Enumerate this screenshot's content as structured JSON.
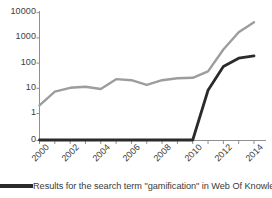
{
  "chart_data": {
    "type": "line",
    "title": "",
    "subtitle": "",
    "xlabel": "",
    "ylabel": "",
    "x": [
      2000,
      2001,
      2002,
      2003,
      2004,
      2005,
      2006,
      2007,
      2008,
      2009,
      2010,
      2011,
      2012,
      2013,
      2014
    ],
    "xlim": [
      2000,
      2014
    ],
    "ylim": [
      0,
      10000
    ],
    "yscale": "log",
    "grid": false,
    "legend_position": "bottom",
    "y_tick_labels": [
      "10000",
      "1000",
      "100",
      "10",
      "1",
      "0"
    ],
    "y_tick_values": [
      10000,
      1000,
      100,
      10,
      1,
      0
    ],
    "x_tick_labels": [
      "2000",
      "2002",
      "2004",
      "2006",
      "2008",
      "2010",
      "2012",
      "2014"
    ],
    "x_tick_values": [
      2000,
      2002,
      2004,
      2006,
      2008,
      2010,
      2012,
      2014
    ],
    "x_tick_rotation": -45,
    "series": [
      {
        "name": "grey-series",
        "color": "#9d9d9d",
        "in_legend": false,
        "values": [
          2,
          7,
          10,
          11,
          9,
          22,
          20,
          13,
          20,
          24,
          25,
          45,
          330,
          1600,
          4000
        ]
      },
      {
        "name": "Results for the search term \"gamification\" in Web Of Knowledge",
        "color": "#2b2b2b",
        "in_legend": true,
        "values": [
          0,
          0,
          0,
          0,
          0,
          0,
          0,
          0,
          0,
          0,
          0,
          8,
          70,
          150,
          185
        ]
      }
    ]
  },
  "legend": {
    "entries": [
      {
        "label": "Results for the search term \"gamification\" in Web Of Knowledge",
        "color": "#2b2b2b",
        "marker": "line-swatch"
      }
    ]
  },
  "colors": {
    "background": "#ffffff",
    "axis": "#8f8f8f",
    "text": "#3a3a3a",
    "series_grey": "#9d9d9d",
    "series_black": "#2b2b2b"
  }
}
